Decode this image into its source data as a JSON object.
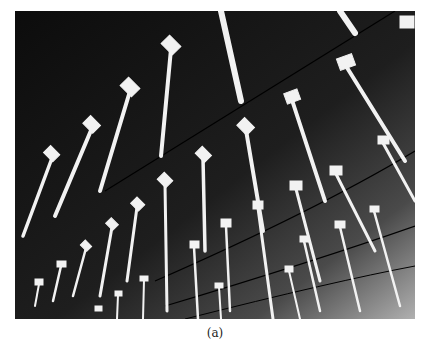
{
  "figure": {
    "caption": "(a)",
    "colors": {
      "ceiling": "#141414",
      "rods": "#f2f2f2",
      "lines": "#000000",
      "background": "#ffffff"
    }
  }
}
